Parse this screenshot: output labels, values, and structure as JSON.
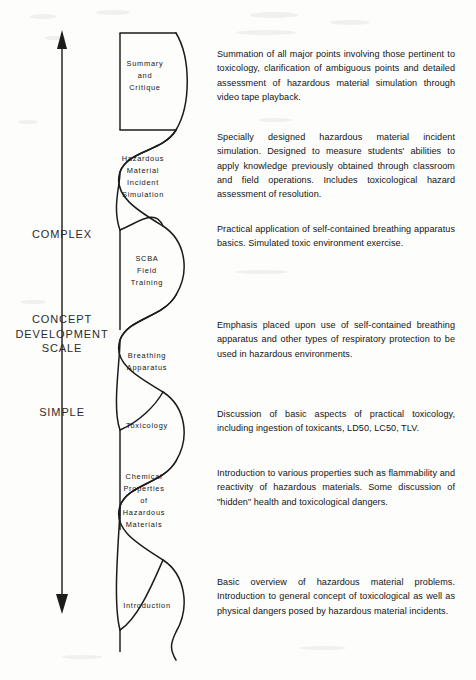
{
  "diagram": {
    "title": "Concept Development Scale",
    "axis": {
      "top_label": "COMPLEX",
      "middle_label": "CONCEPT\nDEVELOPMENT\nSCALE",
      "bottom_label": "SIMPLE",
      "top_arrow": "arrow-up",
      "bottom_arrow": "arrow-down"
    },
    "stages": [
      {
        "id": "summary-and-critique",
        "label": "Summary\nand\nCritique",
        "description": "Summation of all major points involving those pertinent to toxicology, clarification of ambiguous points and detailed assessment of hazardous material simulation through video tape playback."
      },
      {
        "id": "hazardous-material-incident-simulation",
        "label": "Hazardous\nMaterial\nIncident\nSimulation",
        "description": "Specially designed hazardous material incident simulation.  Designed to measure students' abilities to apply knowledge previously obtained through classroom and field operations.  Includes toxicological hazard assessment of resolution."
      },
      {
        "id": "scba-field-training",
        "label": "SCBA\nField\nTraining",
        "description": "Practical application of self-contained breathing apparatus basics.  Simulated toxic environment exercise."
      },
      {
        "id": "breathing-apparatus",
        "label": "Breathing\nApparatus",
        "description": "Emphasis placed upon use of self-contained breathing apparatus and other types of respiratory protection to be used in hazardous environments."
      },
      {
        "id": "toxicology",
        "label": "Toxicology",
        "description": "Discussion of basic aspects of practical toxicology, including ingestion of toxicants, LD50, LC50, TLV."
      },
      {
        "id": "chemical-properties-of-hazardous-materials",
        "label": "Chemical\nProperties\nof\nHazardous\nMaterials",
        "description": "Introduction to various properties such as flammability and reactivity of hazardous materials.  Some discussion of \"hidden\" health and toxicological dangers."
      },
      {
        "id": "introduction",
        "label": "Introduction",
        "description": "Basic overview of hazardous material problems.  Introduction to general concept of toxicological as well as physical dangers posed by hazardous material incidents."
      }
    ],
    "colors": {
      "ink": "#141414",
      "paper": "#fdfdfc",
      "curve": "#1b1b1b"
    }
  }
}
